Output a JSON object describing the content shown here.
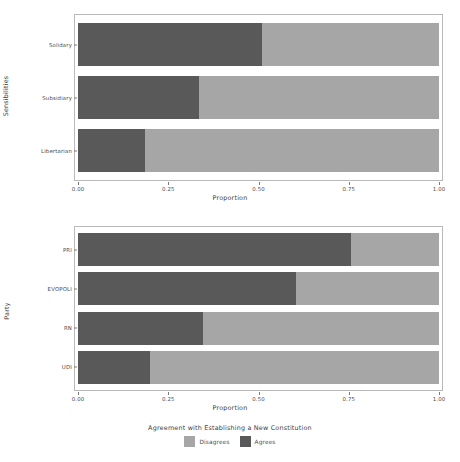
{
  "chart_data": [
    {
      "type": "bar",
      "orientation": "horizontal",
      "stacked": true,
      "normalized": true,
      "panel": "top",
      "title": "",
      "xlabel": "Proportion",
      "ylabel": "Sensibilities",
      "xlim": [
        0,
        1
      ],
      "xticks": [
        0,
        0.25,
        0.5,
        0.75,
        1
      ],
      "xticklabels": [
        "0.00",
        "0.25",
        "0.50",
        "0.75",
        "1.00"
      ],
      "grid": false,
      "categories": [
        "Solidary",
        "Subsidiary",
        "Libertarian"
      ],
      "series": [
        {
          "name": "Agrees",
          "color": "#595959",
          "values": [
            0.51,
            0.335,
            0.185
          ]
        },
        {
          "name": "Disagrees",
          "color": "#a6a6a6",
          "values": [
            0.49,
            0.665,
            0.815
          ]
        }
      ]
    },
    {
      "type": "bar",
      "orientation": "horizontal",
      "stacked": true,
      "normalized": true,
      "panel": "bottom",
      "title": "",
      "xlabel": "Proportion",
      "ylabel": "Party",
      "xlim": [
        0,
        1
      ],
      "xticks": [
        0,
        0.25,
        0.5,
        0.75,
        1
      ],
      "xticklabels": [
        "0.00",
        "0.25",
        "0.50",
        "0.75",
        "1.00"
      ],
      "grid": false,
      "categories": [
        "PRI",
        "EVOPOLI",
        "RN",
        "UDI"
      ],
      "series": [
        {
          "name": "Agrees",
          "color": "#595959",
          "values": [
            0.755,
            0.605,
            0.345,
            0.2
          ]
        },
        {
          "name": "Disagrees",
          "color": "#a6a6a6",
          "values": [
            0.245,
            0.395,
            0.655,
            0.8
          ]
        }
      ]
    }
  ],
  "legend": {
    "title": "Agreement with Establishing a New Constitution",
    "position": "bottom",
    "entries": [
      {
        "label": "Disagrees",
        "color": "#a6a6a6"
      },
      {
        "label": "Agrees",
        "color": "#595959"
      }
    ]
  },
  "style": {
    "background": "#ffffff",
    "frame_color": "#b9b9b9",
    "tick_color": "#7a7a7a",
    "text_color": "#4d4d4d"
  }
}
